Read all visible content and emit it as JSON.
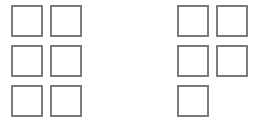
{
  "left_group": {
    "boxes": [
      {
        "row": 0,
        "col": 0
      },
      {
        "row": 0,
        "col": 1
      },
      {
        "row": 1,
        "col": 0
      },
      {
        "row": 1,
        "col": 1
      },
      {
        "row": 2,
        "col": 0
      },
      {
        "row": 2,
        "col": 1
      }
    ]
  },
  "right_group": {
    "boxes": [
      {
        "row": 0,
        "col": 0
      },
      {
        "row": 0,
        "col": 1
      },
      {
        "row": 1,
        "col": 0
      },
      {
        "row": 1,
        "col": 1
      },
      {
        "row": 2,
        "col": 0
      }
    ]
  },
  "colors": {
    "border": "#7a7a7a",
    "background": "#ffffff"
  }
}
